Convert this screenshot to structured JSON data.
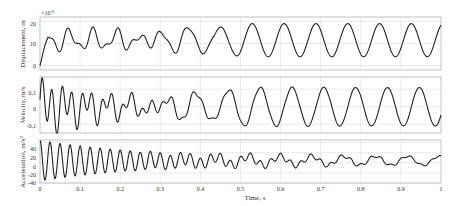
{
  "chart_data": [
    {
      "type": "line",
      "title": "",
      "ylabel": "Displacement, m",
      "ylabel_exponent": "×10⁻⁶",
      "xlabel": "",
      "xlim": [
        0,
        1
      ],
      "ylim": [
        -2,
        22
      ],
      "yticks": [
        "0",
        "10",
        "20"
      ],
      "ytick_values": [
        0,
        10,
        20
      ],
      "grid": true,
      "series": [
        {
          "name": "displacement",
          "description": "Starts at 0, irregular oscillation around ~10 (range ~5–17) up to t≈0.4, then steady sinusoid ~12.5 Hz oscillating between ~3 and ~20"
        }
      ]
    },
    {
      "type": "line",
      "title": "",
      "ylabel": "Velocity, m/s",
      "xlabel": "",
      "xlim": [
        0,
        1
      ],
      "ylim": [
        -0.15,
        0.17
      ],
      "yticks": [
        "-0,1",
        "0",
        "0,1"
      ],
      "ytick_values": [
        -0.1,
        0,
        0.1
      ],
      "grid": true,
      "series": [
        {
          "name": "velocity",
          "description": "High-frequency decaying oscillation (amplitude ~0.15) from t=0, mixed irregular motion t≈0.2–0.45, then steady ~12.5 Hz sinusoid amplitude ~0.12"
        }
      ]
    },
    {
      "type": "line",
      "title": "",
      "ylabel": "Acceleration, m/s²",
      "xlabel": "Time, s",
      "xlim": [
        0,
        1
      ],
      "ylim": [
        -40,
        45
      ],
      "yticks": [
        "-40",
        "-20",
        "0",
        "20",
        "40"
      ],
      "ytick_values": [
        -40,
        -20,
        0,
        20,
        40
      ],
      "xticks": [
        "0",
        "0.1",
        "0.2",
        "0.3",
        "0.4",
        "0.5",
        "0.6",
        "0.7",
        "0.8",
        "0.9",
        "1"
      ],
      "grid": true,
      "series": [
        {
          "name": "acceleration",
          "description": "Decaying high-frequency oscillation from ±40 at t=0 to small ±10 oscillation ~12.5 Hz after t≈0.5"
        }
      ]
    }
  ],
  "labels": {
    "y1": "Displacement, m",
    "y1_exp": "×10",
    "y1_exp_pow": "-6",
    "y2": "Velocity, m/s",
    "y3": "Acceleration, m/s",
    "y3_pow": "2",
    "x": "Time, s",
    "xticks": [
      "0",
      "0.1",
      "0.2",
      "0.3",
      "0.4",
      "0.5",
      "0.6",
      "0.7",
      "0.8",
      "0.9",
      "1"
    ],
    "y1ticks": [
      "20",
      "10",
      "0"
    ],
    "y2ticks": [
      "0,1",
      "0",
      "-0,1"
    ],
    "y3ticks": [
      "40",
      "20",
      "0",
      "-20",
      "-40"
    ]
  }
}
